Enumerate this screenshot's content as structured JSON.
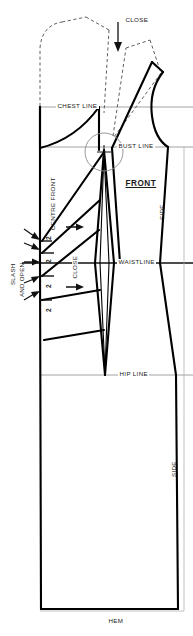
{
  "diagram": {
    "title": "FRONT",
    "type": "sewing-pattern-bodice-draft",
    "canvas": {
      "width": 193,
      "height": 636
    },
    "colors": {
      "outline": "#000000",
      "construction_line": "#8c8c8c",
      "dashed_original": "#4d4d4d",
      "background": "#ffffff",
      "text": "#1a1a1a"
    }
  },
  "labels": {
    "close_top": "CLOSE",
    "chest_line": "CHEST LINE",
    "bust_line": "BUST LINE",
    "front": "FRONT",
    "centre_front": "CENTRE FRONT",
    "side_upper": "SIDE",
    "side_lower": "SIDE",
    "waistline": "WAISTLINE",
    "close_waist": "CLOSE",
    "hip_line": "HIP LINE",
    "hem": "HEM",
    "slash_line1": "SLASH",
    "slash_line2": "AND OPEN"
  },
  "slash_marks": {
    "values": [
      "2",
      "2",
      "2",
      "2"
    ],
    "count": 4,
    "note": "slash-and-open increments along centre front"
  },
  "horizontal_guides": [
    {
      "name": "chest_line",
      "label": "CHEST LINE",
      "y": 107
    },
    {
      "name": "bust_line",
      "label": "BUST LINE",
      "y": 147
    },
    {
      "name": "waistline",
      "label": "WAISTLINE",
      "y": 263
    },
    {
      "name": "hip_line",
      "label": "HIP LINE",
      "y": 375
    },
    {
      "name": "hem",
      "label": "HEM",
      "y": 609
    }
  ]
}
